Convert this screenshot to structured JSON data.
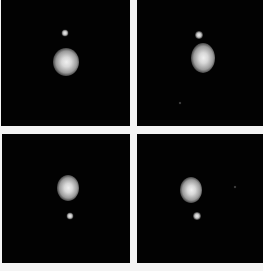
{
  "figure": {
    "layout": "2x2 grid",
    "background_color": "#f4f4f4",
    "panel_color": "#020202",
    "panels": [
      {
        "id": "top-left",
        "rect": {
          "x": 1,
          "y": 0,
          "w": 129,
          "h": 126
        },
        "main": {
          "cx": 65,
          "cy": 62,
          "w": 26,
          "h": 28
        },
        "companion": {
          "cx": 64,
          "cy": 33,
          "d": 7
        },
        "specks": []
      },
      {
        "id": "top-right",
        "rect": {
          "x": 137,
          "y": 0,
          "w": 126,
          "h": 126
        },
        "main": {
          "cx": 66,
          "cy": 58,
          "w": 24,
          "h": 30
        },
        "companion": {
          "cx": 62,
          "cy": 35,
          "d": 8
        },
        "specks": [
          {
            "cx": 43,
            "cy": 103,
            "d": 3
          }
        ]
      },
      {
        "id": "bottom-left",
        "rect": {
          "x": 2,
          "y": 134,
          "w": 128,
          "h": 129
        },
        "main": {
          "cx": 66,
          "cy": 54,
          "w": 22,
          "h": 26
        },
        "companion": {
          "cx": 68,
          "cy": 82,
          "d": 7
        }
      },
      {
        "id": "bottom-right",
        "rect": {
          "x": 137,
          "y": 134,
          "w": 126,
          "h": 129
        },
        "main": {
          "cx": 54,
          "cy": 56,
          "w": 22,
          "h": 26
        },
        "companion": {
          "cx": 60,
          "cy": 82,
          "d": 8
        },
        "specks": [
          {
            "cx": 98,
            "cy": 53,
            "d": 3
          }
        ]
      }
    ]
  }
}
